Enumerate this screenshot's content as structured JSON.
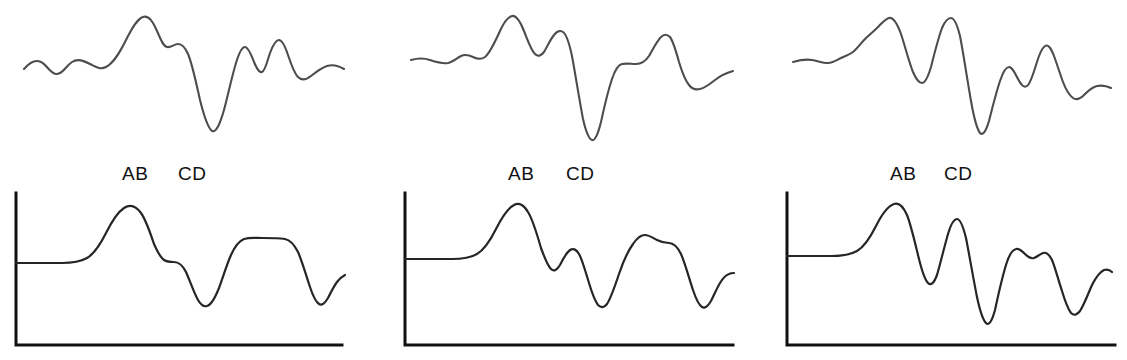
{
  "figure": {
    "type": "multi-panel-waveform-figure",
    "columns": 3,
    "rows": 2,
    "background_color": "#ffffff",
    "top_trace_color": "#4d4d4d",
    "bottom_trace_color": "#262626",
    "axis_color": "#111111"
  },
  "markers": {
    "label_ab": "AB",
    "label_cd": "CD"
  },
  "panels": [
    {
      "id": "column-1",
      "marker_ab": "AB",
      "marker_cd": "CD",
      "ab_x": 122,
      "cd_x": 178,
      "label_y": 164,
      "top": {
        "id": "panel-1-top",
        "path": "M 24,69 C 30,62 35,59 41,62 C 47,65 50,73 56,74 C 62,75 66,66 72,62 C 78,58 84,61 90,64 C 96,67 100,70 106,67 C 114,63 120,52 126,40 C 132,28 137,19 143,17 C 149,15 153,22 157,31 C 161,40 163,46 167,47 C 171,48 174,44 178,44 C 182,44 185,47 188,54 C 192,63 196,82 200,100 C 204,116 208,128 212,131 C 216,133 220,124 224,110 C 228,95 232,76 236,63 C 239,53 242,47 245,47 C 248,47 251,54 254,62 C 257,69 259,73 262,72 C 265,71 267,62 270,53 C 273,45 276,40 279,40 C 282,40 285,46 288,55 C 291,64 294,73 298,77 C 302,81 306,80 311,76 C 316,72 321,68 327,66 C 333,64 339,66 344,69"
      },
      "bottom": {
        "id": "panel-1-bottom",
        "axis_x": 16,
        "axis_top": 193,
        "axis_bottom": 345,
        "axis_right": 342,
        "baseline_y": 263,
        "path": "M 16,263 L 62,263 C 72,263 80,262 87,258 C 94,254 100,245 106,233 C 112,221 118,212 124,208 C 130,204 136,206 141,213 C 146,220 150,232 154,244 C 158,253 161,258 164,260 C 167,262 170,262 174,262 C 178,262 182,264 186,272 C 190,281 194,293 198,300 C 201,305 204,307 207,306 C 211,305 215,298 219,288 C 223,277 227,264 231,255 C 235,246 239,241 244,239 C 250,237 256,238 262,238 C 270,238 278,238 285,239 C 290,240 294,244 298,252 C 302,261 306,275 310,287 C 313,296 316,302 319,304 C 322,306 325,303 328,298 C 331,292 334,286 337,282 C 340,278 343,276 345,275"
      }
    },
    {
      "id": "column-2",
      "marker_ab": "AB",
      "marker_cd": "CD",
      "ab_x": 508,
      "cd_x": 566,
      "label_y": 164,
      "top": {
        "id": "panel-2-top",
        "path": "M 411,60 C 418,58 424,58 430,60 C 436,62 442,64 448,63 C 453,62 457,58 461,56 C 465,54 469,55 473,57 C 477,59 481,60 485,57 C 490,53 495,42 500,31 C 504,22 508,17 512,16 C 516,15 520,21 524,31 C 528,41 531,50 535,54 C 538,57 541,56 544,52 C 547,47 550,40 554,35 C 557,31 560,30 563,32 C 566,34 569,42 572,56 C 575,72 579,98 583,119 C 586,132 589,139 592,140 C 595,141 598,134 601,122 C 604,108 608,91 612,79 C 615,70 618,65 622,64 C 626,63 631,64 636,64 C 641,64 645,62 649,56 C 653,49 657,41 661,37 C 664,34 667,34 670,37 C 673,41 676,51 679,62 C 682,72 685,80 689,85 C 692,89 696,90 700,89 C 705,88 710,84 715,80 C 720,76 726,73 733,71"
      },
      "bottom": {
        "id": "panel-2-bottom",
        "axis_x": 405,
        "axis_top": 193,
        "axis_bottom": 345,
        "axis_right": 733,
        "baseline_y": 259,
        "path": "M 405,259 L 452,259 C 462,259 470,258 477,254 C 484,250 490,241 496,229 C 502,217 508,208 514,205 C 519,202 524,205 528,212 C 533,220 537,234 541,248 C 545,259 548,266 551,269 C 554,272 557,270 560,265 C 563,259 566,253 570,250 C 573,248 576,249 579,254 C 582,259 585,270 589,283 C 592,293 595,301 598,305 C 601,308 604,308 607,304 C 611,298 615,286 619,274 C 623,262 628,251 633,244 C 637,238 641,235 645,235 C 649,235 653,238 657,240 C 661,242 665,243 669,243 C 673,243 677,246 681,254 C 685,263 689,278 693,290 C 696,299 699,305 702,307 C 705,309 708,306 711,301 C 714,295 717,288 720,283 C 723,278 726,275 729,274 C 731,273 733,273 734,273"
      }
    },
    {
      "id": "column-3",
      "marker_ab": "AB",
      "marker_cd": "CD",
      "ab_x": 890,
      "cd_x": 944,
      "label_y": 164,
      "top": {
        "id": "panel-3-top",
        "path": "M 793,62 C 800,60 806,59 812,60 C 818,61 823,63 828,63 C 833,63 837,60 841,58 C 845,56 849,55 853,52 C 857,49 861,43 865,39 C 869,35 873,32 877,28 C 881,24 885,19 889,18 C 893,17 897,23 901,34 C 905,46 909,62 913,72 C 916,79 919,83 922,83 C 925,83 928,77 931,67 C 934,55 938,39 942,28 C 945,21 948,18 951,18 C 954,18 957,24 960,36 C 963,51 967,78 971,101 C 974,118 977,129 980,133 C 983,136 986,131 989,121 C 992,109 996,93 1000,81 C 1003,72 1006,67 1009,67 C 1012,67 1015,73 1018,79 C 1021,85 1024,88 1027,86 C 1030,84 1033,75 1036,65 C 1039,55 1042,48 1045,46 C 1048,44 1051,48 1054,56 C 1057,64 1060,74 1063,82 C 1066,90 1069,95 1073,98 C 1076,100 1080,99 1084,95 C 1088,91 1092,87 1097,86 C 1102,85 1107,86 1111,88"
      },
      "bottom": {
        "id": "panel-3-bottom",
        "axis_x": 787,
        "axis_top": 193,
        "axis_bottom": 345,
        "axis_right": 1115,
        "baseline_y": 256,
        "path": "M 787,256 L 832,256 C 842,256 850,255 857,251 C 864,247 870,238 876,226 C 882,214 888,206 894,204 C 899,202 903,206 907,215 C 911,225 915,243 919,259 C 922,271 925,280 928,283 C 931,286 934,283 937,275 C 940,265 944,248 948,234 C 951,224 954,219 957,219 C 960,219 963,226 966,238 C 969,253 973,277 977,297 C 980,311 983,320 986,323 C 989,326 992,321 995,310 C 998,296 1002,278 1006,265 C 1009,255 1012,250 1016,249 C 1019,248 1022,251 1025,254 C 1028,257 1031,259 1034,258 C 1037,257 1040,254 1043,253 C 1046,252 1049,254 1052,260 C 1055,267 1058,279 1062,291 C 1065,301 1068,309 1071,313 C 1074,316 1077,315 1080,311 C 1084,305 1088,294 1092,285 C 1096,277 1100,272 1104,270 C 1107,269 1110,270 1112,272"
      }
    }
  ]
}
